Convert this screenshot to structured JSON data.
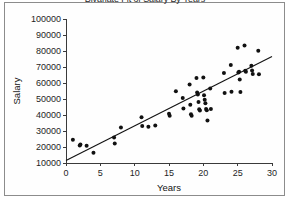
{
  "window": {
    "background_color": "#ffffff",
    "border_color": "#8c8c8c"
  },
  "chart_data": {
    "type": "scatter",
    "title": "Bivariate Fit of Salary By Years",
    "xlabel": "Years",
    "ylabel": "Salary",
    "xlim": [
      0,
      30
    ],
    "ylim": [
      10000,
      100000
    ],
    "xticks": [
      0,
      5,
      10,
      15,
      20,
      25,
      30
    ],
    "yticks": [
      10000,
      20000,
      30000,
      40000,
      50000,
      60000,
      70000,
      80000,
      90000,
      100000
    ],
    "xtick_labels": [
      "0",
      "5",
      "10",
      "15",
      "20",
      "25",
      "30"
    ],
    "ytick_labels": [
      "10000",
      "20000",
      "30000",
      "40000",
      "50000",
      "60000",
      "70000",
      "80000",
      "90000",
      "100000"
    ],
    "grid": false,
    "legend": false,
    "marker_color": "#111111",
    "marker_size": 2.0,
    "line_color": "#111111",
    "fit_line": {
      "label": "linear regression fit",
      "x": [
        0,
        30
      ],
      "y": [
        11500,
        76500
      ],
      "slope": 2167,
      "intercept": 11500
    },
    "points": [
      {
        "x": 1.0,
        "y": 24600
      },
      {
        "x": 2.0,
        "y": 21000
      },
      {
        "x": 2.1,
        "y": 21600
      },
      {
        "x": 3.0,
        "y": 20800
      },
      {
        "x": 4.0,
        "y": 16400
      },
      {
        "x": 7.0,
        "y": 26000
      },
      {
        "x": 7.1,
        "y": 22200
      },
      {
        "x": 8.0,
        "y": 32200
      },
      {
        "x": 11.0,
        "y": 38600
      },
      {
        "x": 11.1,
        "y": 33200
      },
      {
        "x": 12.0,
        "y": 32600
      },
      {
        "x": 13.0,
        "y": 33400
      },
      {
        "x": 15.0,
        "y": 40800
      },
      {
        "x": 15.1,
        "y": 39600
      },
      {
        "x": 16.0,
        "y": 54800
      },
      {
        "x": 17.0,
        "y": 50600
      },
      {
        "x": 17.1,
        "y": 44000
      },
      {
        "x": 18.0,
        "y": 59000
      },
      {
        "x": 18.1,
        "y": 46400
      },
      {
        "x": 18.2,
        "y": 40400
      },
      {
        "x": 18.3,
        "y": 39600
      },
      {
        "x": 19.0,
        "y": 63200
      },
      {
        "x": 19.1,
        "y": 54000
      },
      {
        "x": 19.2,
        "y": 52800
      },
      {
        "x": 19.3,
        "y": 48200
      },
      {
        "x": 19.4,
        "y": 43600
      },
      {
        "x": 19.5,
        "y": 42800
      },
      {
        "x": 20.0,
        "y": 63400
      },
      {
        "x": 20.1,
        "y": 52400
      },
      {
        "x": 20.2,
        "y": 49600
      },
      {
        "x": 20.3,
        "y": 47400
      },
      {
        "x": 20.4,
        "y": 43800
      },
      {
        "x": 20.5,
        "y": 43000
      },
      {
        "x": 20.6,
        "y": 36600
      },
      {
        "x": 21.0,
        "y": 56600
      },
      {
        "x": 21.1,
        "y": 43800
      },
      {
        "x": 23.0,
        "y": 66200
      },
      {
        "x": 23.1,
        "y": 53800
      },
      {
        "x": 24.0,
        "y": 71200
      },
      {
        "x": 24.1,
        "y": 54600
      },
      {
        "x": 25.0,
        "y": 82000
      },
      {
        "x": 25.1,
        "y": 66600
      },
      {
        "x": 25.2,
        "y": 67000
      },
      {
        "x": 25.3,
        "y": 62200
      },
      {
        "x": 25.4,
        "y": 54400
      },
      {
        "x": 26.0,
        "y": 83400
      },
      {
        "x": 26.1,
        "y": 67600
      },
      {
        "x": 26.2,
        "y": 67000
      },
      {
        "x": 27.0,
        "y": 70800
      },
      {
        "x": 27.1,
        "y": 67800
      },
      {
        "x": 27.2,
        "y": 65600
      },
      {
        "x": 28.0,
        "y": 80200
      },
      {
        "x": 28.1,
        "y": 65400
      }
    ]
  }
}
